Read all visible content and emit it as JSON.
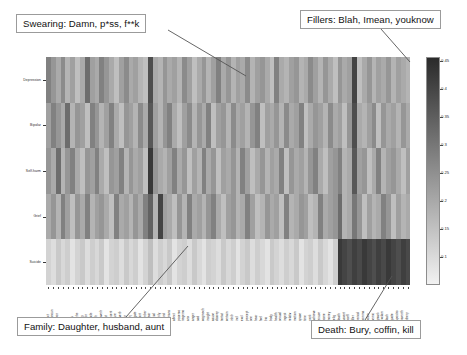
{
  "figure": {
    "type": "heatmap",
    "background": "#ffffff",
    "plot_area": {
      "left": 46,
      "top": 57,
      "width": 364,
      "height": 228
    }
  },
  "annotations": [
    {
      "name": "swearing",
      "label": "Swearing: Damn, p*ss, f**k",
      "box": {
        "left": 16,
        "top": 14,
        "width": 152,
        "height": 19
      },
      "leader": {
        "x1": 168,
        "y1": 30,
        "x2": 246,
        "y2": 76
      }
    },
    {
      "name": "fillers",
      "label": "Fillers: Blah, Imean, youknow",
      "box": {
        "left": 300,
        "top": 10,
        "width": 160,
        "height": 19
      },
      "leader": {
        "x1": 381,
        "y1": 29,
        "x2": 410,
        "y2": 62
      }
    },
    {
      "name": "family",
      "label": "Family: Daughter, husband, aunt",
      "box": {
        "left": 17,
        "top": 317,
        "width": 174,
        "height": 19
      },
      "leader": {
        "x1": 126,
        "y1": 317,
        "x2": 188,
        "y2": 246
      }
    },
    {
      "name": "death",
      "label": "Death: Bury, coffin, kill",
      "box": {
        "left": 311,
        "top": 320,
        "width": 126,
        "height": 19
      },
      "leader": {
        "x1": 365,
        "y1": 320,
        "x2": 392,
        "y2": 276
      }
    }
  ],
  "colorbar": {
    "name": "intensity-colorbar",
    "orientation": "vertical",
    "vmin": 0.08,
    "vmax": 0.47,
    "colormap": "grayscale-inverted",
    "ticks": [
      {
        "value": 0.45,
        "y": 61
      },
      {
        "value": 0.4,
        "y": 89
      },
      {
        "value": 0.35,
        "y": 117
      },
      {
        "value": 0.3,
        "y": 145
      },
      {
        "value": 0.25,
        "y": 173
      },
      {
        "value": 0.2,
        "y": 201
      },
      {
        "value": 0.15,
        "y": 229
      },
      {
        "value": 0.1,
        "y": 257
      }
    ],
    "tick_labels": [
      "0.45",
      "0.4",
      "0.35",
      "0.3",
      "0.25",
      "0.2",
      "0.15",
      "0.1"
    ]
  },
  "chart_data": {
    "type": "heatmap",
    "title": "",
    "xlabel": "",
    "ylabel": "",
    "colormap": "gray_r",
    "zlim": [
      0.08,
      0.47
    ],
    "zlabel": "",
    "grid": false,
    "legend_position": "right-colorbar",
    "row_labels": [
      "Depression",
      "Bipolar",
      "Self-harm",
      "Grief",
      "Suicide"
    ],
    "col_labels": [
      "funct",
      "pronoun",
      "ppron",
      "i",
      "we",
      "you",
      "shehe",
      "they",
      "ipron",
      "article",
      "verb",
      "auxverb",
      "past",
      "present",
      "future",
      "adverb",
      "prep",
      "conj",
      "negate",
      "quant",
      "number",
      "swear",
      "social",
      "family",
      "friend",
      "humans",
      "affect",
      "posemo",
      "negemo",
      "anx",
      "anger",
      "sad",
      "cogmech",
      "insight",
      "cause",
      "discrep",
      "tentat",
      "certain",
      "inhib",
      "incl",
      "excl",
      "percept",
      "see",
      "hear",
      "feel",
      "bio",
      "body",
      "health",
      "sexual",
      "ingest",
      "relativ",
      "motion",
      "space",
      "time",
      "work",
      "achieve",
      "leisure",
      "home",
      "money",
      "relig",
      "death",
      "assent",
      "nonfl",
      "filler",
      "period",
      "comma",
      "colon",
      "semic",
      "qmark",
      "exclam",
      "dash",
      "quote",
      "apostro",
      "parenth",
      "otherp"
    ],
    "values": [
      [
        0.3,
        0.26,
        0.22,
        0.28,
        0.2,
        0.24,
        0.18,
        0.22,
        0.34,
        0.24,
        0.22,
        0.3,
        0.26,
        0.22,
        0.18,
        0.24,
        0.28,
        0.22,
        0.24,
        0.2,
        0.18,
        0.4,
        0.22,
        0.2,
        0.26,
        0.22,
        0.24,
        0.2,
        0.28,
        0.24,
        0.18,
        0.22,
        0.26,
        0.2,
        0.24,
        0.3,
        0.22,
        0.26,
        0.2,
        0.24,
        0.22,
        0.28,
        0.2,
        0.24,
        0.26,
        0.22,
        0.18,
        0.3,
        0.22,
        0.2,
        0.24,
        0.26,
        0.2,
        0.22,
        0.28,
        0.24,
        0.2,
        0.26,
        0.22,
        0.18,
        0.26,
        0.22,
        0.24,
        0.42,
        0.18,
        0.22,
        0.26,
        0.2,
        0.24,
        0.22,
        0.26,
        0.2,
        0.24,
        0.22,
        0.2
      ],
      [
        0.24,
        0.3,
        0.26,
        0.22,
        0.34,
        0.2,
        0.26,
        0.24,
        0.18,
        0.3,
        0.26,
        0.2,
        0.24,
        0.3,
        0.22,
        0.18,
        0.26,
        0.24,
        0.2,
        0.28,
        0.22,
        0.38,
        0.24,
        0.2,
        0.26,
        0.3,
        0.22,
        0.18,
        0.24,
        0.28,
        0.2,
        0.26,
        0.22,
        0.3,
        0.18,
        0.24,
        0.26,
        0.2,
        0.28,
        0.22,
        0.24,
        0.2,
        0.26,
        0.3,
        0.18,
        0.24,
        0.22,
        0.26,
        0.2,
        0.28,
        0.22,
        0.24,
        0.3,
        0.18,
        0.22,
        0.26,
        0.24,
        0.2,
        0.28,
        0.22,
        0.24,
        0.18,
        0.26,
        0.4,
        0.22,
        0.2,
        0.24,
        0.28,
        0.18,
        0.26,
        0.22,
        0.24,
        0.2,
        0.26,
        0.22
      ],
      [
        0.26,
        0.22,
        0.34,
        0.2,
        0.26,
        0.3,
        0.22,
        0.18,
        0.26,
        0.24,
        0.3,
        0.22,
        0.18,
        0.26,
        0.24,
        0.3,
        0.2,
        0.26,
        0.22,
        0.24,
        0.18,
        0.44,
        0.26,
        0.22,
        0.2,
        0.24,
        0.3,
        0.22,
        0.26,
        0.18,
        0.24,
        0.2,
        0.3,
        0.22,
        0.26,
        0.18,
        0.24,
        0.22,
        0.26,
        0.2,
        0.3,
        0.24,
        0.18,
        0.22,
        0.26,
        0.2,
        0.24,
        0.22,
        0.3,
        0.18,
        0.26,
        0.22,
        0.24,
        0.2,
        0.26,
        0.3,
        0.22,
        0.18,
        0.24,
        0.26,
        0.3,
        0.2,
        0.22,
        0.38,
        0.24,
        0.26,
        0.18,
        0.22,
        0.3,
        0.2,
        0.24,
        0.26,
        0.22,
        0.18,
        0.24
      ],
      [
        0.22,
        0.26,
        0.2,
        0.3,
        0.24,
        0.18,
        0.26,
        0.22,
        0.3,
        0.2,
        0.24,
        0.26,
        0.22,
        0.18,
        0.3,
        0.22,
        0.24,
        0.2,
        0.26,
        0.22,
        0.3,
        0.36,
        0.2,
        0.42,
        0.24,
        0.22,
        0.18,
        0.26,
        0.2,
        0.3,
        0.22,
        0.24,
        0.2,
        0.26,
        0.3,
        0.22,
        0.18,
        0.24,
        0.26,
        0.2,
        0.22,
        0.3,
        0.24,
        0.18,
        0.2,
        0.26,
        0.22,
        0.24,
        0.18,
        0.3,
        0.2,
        0.22,
        0.26,
        0.24,
        0.18,
        0.2,
        0.3,
        0.22,
        0.24,
        0.26,
        0.34,
        0.2,
        0.22,
        0.32,
        0.26,
        0.18,
        0.24,
        0.2,
        0.22,
        0.3,
        0.26,
        0.18,
        0.24,
        0.2,
        0.22
      ],
      [
        0.14,
        0.12,
        0.16,
        0.13,
        0.15,
        0.11,
        0.14,
        0.16,
        0.12,
        0.15,
        0.13,
        0.16,
        0.11,
        0.14,
        0.15,
        0.12,
        0.16,
        0.13,
        0.15,
        0.11,
        0.14,
        0.18,
        0.12,
        0.15,
        0.13,
        0.16,
        0.11,
        0.14,
        0.15,
        0.12,
        0.16,
        0.13,
        0.11,
        0.15,
        0.14,
        0.12,
        0.16,
        0.13,
        0.15,
        0.11,
        0.14,
        0.16,
        0.12,
        0.15,
        0.13,
        0.11,
        0.16,
        0.14,
        0.12,
        0.15,
        0.13,
        0.16,
        0.11,
        0.14,
        0.15,
        0.12,
        0.16,
        0.13,
        0.11,
        0.15,
        0.44,
        0.42,
        0.4,
        0.43,
        0.41,
        0.44,
        0.42,
        0.4,
        0.43,
        0.41,
        0.44,
        0.42,
        0.4,
        0.43,
        0.41
      ]
    ]
  }
}
